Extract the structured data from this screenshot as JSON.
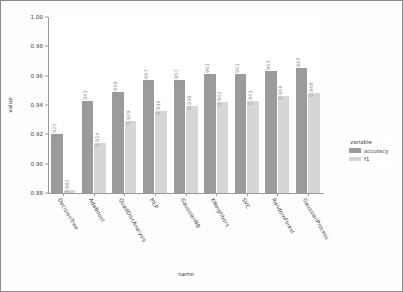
{
  "chart_data": {
    "type": "bar",
    "title": "",
    "xlabel": "name",
    "ylabel": "value",
    "ylim": [
      0.88,
      1.0
    ],
    "yticks": [
      "1.00",
      "0.98",
      "0.96",
      "0.94",
      "0.92",
      "0.90",
      "0.88"
    ],
    "ytick_values": [
      1.0,
      0.98,
      0.96,
      0.94,
      0.92,
      0.9,
      0.88
    ],
    "grid": false,
    "legend_position": "right",
    "legend_title": "variable",
    "categories": [
      "DecisionTree",
      "AdaBoost",
      "QuadDiscAnalysis",
      "MLP",
      "GaussianNB",
      "KNeighbors",
      "SVC",
      "RandomForest",
      "GaussianProcess"
    ],
    "series": [
      {
        "name": "accuracy",
        "color": "#9b9b9b",
        "values": [
          0.92,
          0.943,
          0.949,
          0.957,
          0.957,
          0.961,
          0.961,
          0.963,
          0.965
        ],
        "labels": [
          "0.920",
          "0.943",
          "0.949",
          "0.957",
          "0.957",
          "0.961",
          "0.961",
          "0.963",
          "0.965"
        ]
      },
      {
        "name": "f1",
        "color": "#d6d6d6",
        "values": [
          0.882,
          0.914,
          0.929,
          0.936,
          0.939,
          0.942,
          0.943,
          0.946,
          0.948
        ],
        "labels": [
          "0.882",
          "0.914",
          "0.929",
          "0.936",
          "0.939",
          "0.942",
          "0.943",
          "0.946",
          "0.948"
        ]
      }
    ]
  },
  "legend": {
    "title": "variable",
    "entries": [
      {
        "label": "accuracy",
        "color": "#9b9b9b"
      },
      {
        "label": "f1",
        "color": "#d6d6d6"
      }
    ]
  },
  "axes": {
    "y_title": "value",
    "x_title": "name"
  }
}
